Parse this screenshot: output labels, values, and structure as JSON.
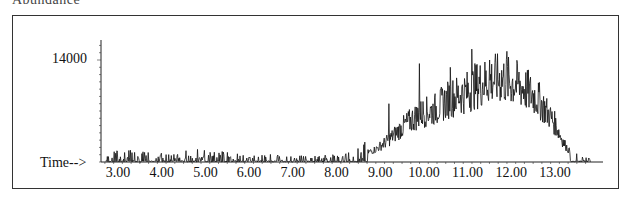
{
  "header": {
    "text": "Abundance"
  },
  "chart_data": {
    "type": "line",
    "title": "Abundance",
    "xlabel": "Time-->",
    "ylabel": "",
    "y_tick_label": "14000",
    "x_ticks": [
      "3.00",
      "4.00",
      "5.00",
      "6.00",
      "7.00",
      "8.00",
      "9.00",
      "10.00",
      "11.00",
      "12.00",
      "13.00"
    ],
    "xlim": [
      2.6,
      13.9
    ],
    "ylim": [
      0,
      19500
    ],
    "grid": false,
    "legend": "none",
    "series": [
      {
        "name": "TIC",
        "x": [
          2.7,
          3.0,
          3.5,
          4.0,
          4.5,
          5.0,
          5.5,
          6.0,
          6.5,
          7.0,
          7.5,
          8.0,
          8.3,
          8.6,
          8.9,
          9.2,
          9.4,
          9.6,
          9.8,
          10.0,
          10.2,
          10.4,
          10.6,
          10.8,
          11.0,
          11.2,
          11.4,
          11.6,
          11.8,
          12.0,
          12.2,
          12.4,
          12.6,
          12.8,
          13.0,
          13.2,
          13.4,
          13.6,
          13.8
        ],
        "values": [
          300,
          800,
          700,
          600,
          700,
          900,
          600,
          500,
          500,
          400,
          400,
          500,
          700,
          1200,
          2000,
          3500,
          4800,
          6000,
          7000,
          7800,
          8000,
          9000,
          10000,
          10500,
          11000,
          12000,
          12500,
          13000,
          13000,
          12500,
          12000,
          11000,
          10000,
          8000,
          6000,
          3000,
          1000,
          400,
          300
        ]
      }
    ],
    "peaks": [
      {
        "x": 9.2,
        "y": 8000
      },
      {
        "x": 9.9,
        "y": 13500
      },
      {
        "x": 10.6,
        "y": 13000
      },
      {
        "x": 11.1,
        "y": 15500
      },
      {
        "x": 11.5,
        "y": 14000
      },
      {
        "x": 11.9,
        "y": 15200
      }
    ]
  }
}
